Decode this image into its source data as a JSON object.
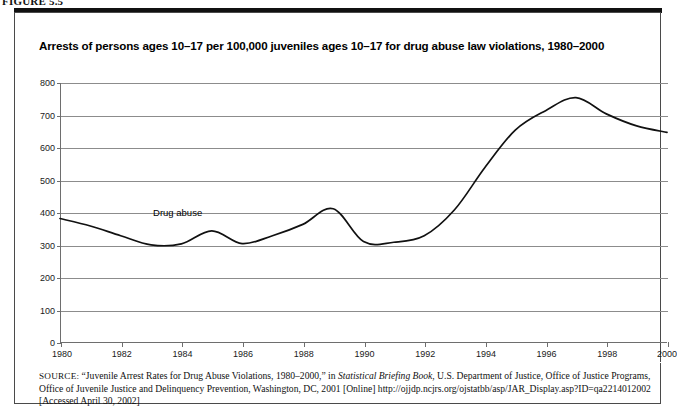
{
  "figure": {
    "label": "FIGURE 5.5"
  },
  "chart_title": "Arrests of persons ages 10–17 per 100,000 juveniles ages 10–17 for drug abuse law violations, 1980–2000",
  "source": {
    "prefix": "SOURCE:",
    "part1": " “Juvenile Arrest Rates for Drug Abuse Violations, 1980–2000,” in ",
    "italic1": "Statistical Briefing Book",
    "part2": ", U.S. Department of Justice, Office of Justice Programs, Office of Juvenile Justice and Delinquency Prevention, Washington, DC, 2001 [Online] http://ojjdp.ncjrs.org/ojstatbb/asp/JAR_Display.asp?ID=qa2214012002 [Accessed April 30, 2002]"
  },
  "chart_data": {
    "type": "line",
    "title": "Arrests of persons ages 10–17 per 100,000 juveniles ages 10–17 for drug abuse law violations, 1980–2000",
    "xlabel": "",
    "ylabel": "",
    "xlim": [
      1980,
      2000
    ],
    "ylim": [
      0,
      800
    ],
    "ytick_step": 100,
    "yticks": [
      0,
      100,
      200,
      300,
      400,
      500,
      600,
      700,
      800
    ],
    "xticks": [
      1980,
      1982,
      1984,
      1986,
      1988,
      1990,
      1992,
      1994,
      1996,
      1998,
      2000
    ],
    "xtick_labels": [
      "1980",
      "1982",
      "1984",
      "1986",
      "1988",
      "1990",
      "1992",
      "1994",
      "1996",
      "1998",
      "2000"
    ],
    "grid": true,
    "grid_axis": "y",
    "legend_position": "inline-annotation",
    "line_color": "#111111",
    "series": [
      {
        "name": "Drug abuse",
        "annotation": "Drug abuse",
        "x": [
          1980,
          1981,
          1982,
          1983,
          1984,
          1985,
          1986,
          1987,
          1988,
          1989,
          1990,
          1991,
          1992,
          1993,
          1994,
          1995,
          1996,
          1997,
          1998,
          1999,
          2000
        ],
        "values": [
          383,
          360,
          330,
          302,
          305,
          345,
          306,
          330,
          365,
          413,
          312,
          310,
          330,
          410,
          540,
          655,
          715,
          755,
          705,
          668,
          648
        ]
      }
    ]
  }
}
